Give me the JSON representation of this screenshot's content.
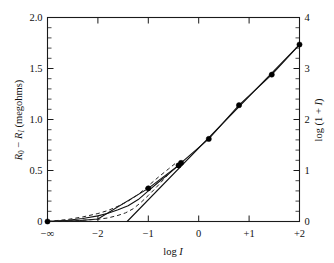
{
  "figure": {
    "title": "",
    "background_color": "#ffffff",
    "line_color": "#111111",
    "marker_color": "#000000"
  },
  "axes": {
    "left": {
      "label_parts": {
        "r0": "R",
        "r0_sub": "0",
        "minus": " − ",
        "ri": "R",
        "ri_sub": "I",
        "units": " (megohms)"
      },
      "label_text": "R0 − RI (megohms)",
      "ticks": [
        "0",
        "0.5",
        "1.0",
        "1.5",
        "2.0"
      ],
      "range": [
        0,
        2.0
      ],
      "minor_step": 0.1
    },
    "right": {
      "label_text": "log (1 + I)",
      "label_prefix": "log (1 + ",
      "label_ital": "I",
      "label_suffix": ")",
      "ticks": [
        "0",
        "1",
        "2",
        "3",
        "4"
      ],
      "range": [
        0,
        4
      ],
      "minor_step": 0.2
    },
    "bottom": {
      "label_prefix": "log ",
      "label_ital": "I",
      "label_text": "log I",
      "ticks": [
        "−∞",
        "−2",
        "−1",
        "0",
        "+1",
        "+2"
      ],
      "tick_values": [
        -3,
        -2,
        -1,
        0,
        1,
        2
      ],
      "range": [
        -3,
        2
      ]
    }
  },
  "chart_data": {
    "type": "line",
    "title": "",
    "xlabel": "log I",
    "ylabel": "R0 − RI (megohms)",
    "y2label": "log (1 + I)",
    "xlim": [
      -3,
      2
    ],
    "ylim": [
      0,
      2.0
    ],
    "y2lim": [
      0,
      4
    ],
    "grid": false,
    "legend": "none",
    "xticks": [
      -3,
      -2,
      -1,
      0,
      1,
      2
    ],
    "xticklabels": [
      "−∞",
      "−2",
      "−1",
      "0",
      "+1",
      "+2"
    ],
    "yticks": [
      0,
      0.5,
      1.0,
      1.5,
      2.0
    ],
    "yticklabels": [
      "0",
      "0.5",
      "1.0",
      "1.5",
      "2.0"
    ],
    "y2ticks": [
      0,
      1,
      2,
      3,
      4
    ],
    "y2ticklabels": [
      "0",
      "1",
      "2",
      "3",
      "4"
    ],
    "series": [
      {
        "name": "observed",
        "style": "solid-with-markers",
        "marker": "filled-circle",
        "x": [
          -3.0,
          -2.35,
          -2.0,
          -1.0,
          -0.4,
          -0.35,
          0.2,
          0.8,
          1.45,
          2.0
        ],
        "y": [
          0.0,
          0.01,
          0.025,
          0.325,
          0.55,
          0.575,
          0.81,
          1.14,
          1.44,
          1.735
        ]
      },
      {
        "name": "theoretical-solid",
        "style": "solid",
        "x": [
          -3.0,
          -2.6,
          -2.3,
          -2.0,
          -1.8,
          -1.6,
          -1.4,
          -1.2,
          -1.0,
          -0.8,
          -0.6,
          -0.4
        ],
        "y": [
          0.0,
          0.012,
          0.03,
          0.055,
          0.08,
          0.115,
          0.155,
          0.215,
          0.3,
          0.385,
          0.465,
          0.55
        ]
      },
      {
        "name": "theoretical-upper-dashed",
        "style": "dashed",
        "x": [
          -3.0,
          -2.6,
          -2.3,
          -2.0,
          -1.8,
          -1.6,
          -1.4,
          -1.2,
          -1.0,
          -0.8,
          -0.6,
          -0.45
        ],
        "y": [
          0.0,
          0.02,
          0.045,
          0.078,
          0.108,
          0.15,
          0.2,
          0.265,
          0.35,
          0.435,
          0.515,
          0.575
        ]
      },
      {
        "name": "theoretical-lower-dashed",
        "style": "dashed",
        "x": [
          -3.0,
          -2.6,
          -2.3,
          -2.0,
          -1.8,
          -1.6,
          -1.45,
          -1.3,
          -1.15,
          -1.0,
          -0.85,
          -0.7,
          -0.55
        ],
        "y": [
          0.0,
          0.005,
          0.012,
          0.022,
          0.035,
          0.06,
          0.085,
          0.125,
          0.185,
          0.255,
          0.33,
          0.41,
          0.49
        ]
      },
      {
        "name": "asymptote-line",
        "style": "solid-straight",
        "x": [
          -1.42,
          2.0
        ],
        "y": [
          0.0,
          1.735
        ]
      }
    ],
    "markers": [
      {
        "x": -3.0,
        "y": 0.0
      },
      {
        "x": -1.0,
        "y": 0.325
      },
      {
        "x": -0.4,
        "y": 0.55
      },
      {
        "x": -0.35,
        "y": 0.575
      },
      {
        "x": 0.2,
        "y": 0.81
      },
      {
        "x": 0.8,
        "y": 1.14
      },
      {
        "x": 1.45,
        "y": 1.44
      },
      {
        "x": 2.0,
        "y": 1.735
      }
    ]
  }
}
